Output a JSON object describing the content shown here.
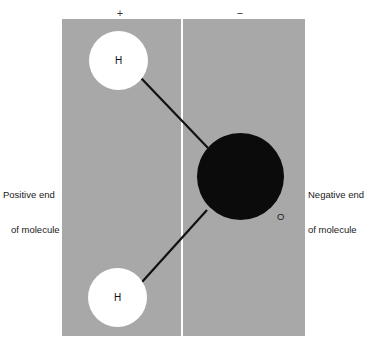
{
  "figure": {
    "name": "water-molecule-polarity-diagram",
    "background_color": "#ffffff",
    "panel_color": "#a8a8a8",
    "divider_color": "#ffffff"
  },
  "signs": {
    "positive": "+",
    "negative": "−"
  },
  "captions": {
    "left": {
      "line1": "Positive end",
      "line2": "of molecule"
    },
    "right": {
      "line1": "Negative end",
      "line2": "of molecule"
    }
  },
  "atoms": {
    "hydrogen_top": {
      "label": "H",
      "color": "#ffffff",
      "text_color": "#111111"
    },
    "hydrogen_bottom": {
      "label": "H",
      "color": "#ffffff",
      "text_color": "#111111"
    },
    "oxygen": {
      "label": "O",
      "color": "#0b0b0b",
      "text_color": "#1a1a1a"
    }
  },
  "bonds": {
    "color": "#111111",
    "upper": {
      "x1": 141,
      "y1": 78,
      "x2": 208,
      "y2": 148
    },
    "lower": {
      "x1": 207,
      "y1": 210,
      "x2": 142,
      "y2": 282
    }
  }
}
